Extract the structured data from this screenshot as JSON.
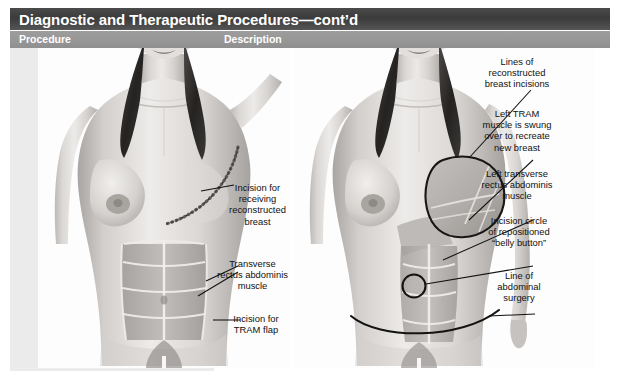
{
  "header": {
    "title": "Diagnostic and Therapeutic Procedures—cont’d",
    "columns": {
      "procedure": "Procedure",
      "description": "Description"
    },
    "title_bar_color": "#3b3b3b",
    "column_band_color": "#969696",
    "title_text_color": "#ffffff"
  },
  "figures": [
    {
      "letter": "A.",
      "name": "pre-operative-tram-flap-diagram",
      "callouts": [
        {
          "id": "incision-receiving-reconstructed-breast",
          "text": "Incision for\nreceiving\nreconstructed\nbreast"
        },
        {
          "id": "transverse-rectus-abdominis-muscle",
          "text": "Transverse\nrectus abdominis\nmuscle"
        },
        {
          "id": "incision-for-tram-flap",
          "text": "Incision for\nTRAM flap"
        }
      ]
    },
    {
      "letter": "B.",
      "name": "post-operative-tram-flap-diagram",
      "callouts": [
        {
          "id": "lines-of-reconstructed-breast-incisions",
          "text": "Lines of\nreconstructed\nbreast incisions"
        },
        {
          "id": "left-tram-muscle-swung-over",
          "text": "Left TRAM\nmuscle is swung\nover to recreate\nnew breast"
        },
        {
          "id": "left-transverse-rectus-abdominis-muscle",
          "text": "Left transverse\nrectus abdominis\nmuscle"
        },
        {
          "id": "incision-circle-repositioned-belly-button",
          "text": "Incision circle\nof repositioned\n“belly button”"
        },
        {
          "id": "line-of-abdominal-surgery",
          "text": "Line of\nabdominal\nsurgery"
        }
      ]
    }
  ],
  "palette": {
    "page_background": "#ffffff",
    "procedure_column": "#ebebeb",
    "skin_light": "#e8e6e4",
    "skin_mid": "#c9c6c3",
    "skin_shadow": "#9c9996",
    "hair_dark": "#2f2d2c",
    "muscle_gray": "#b2afad",
    "line_black": "#111111"
  }
}
